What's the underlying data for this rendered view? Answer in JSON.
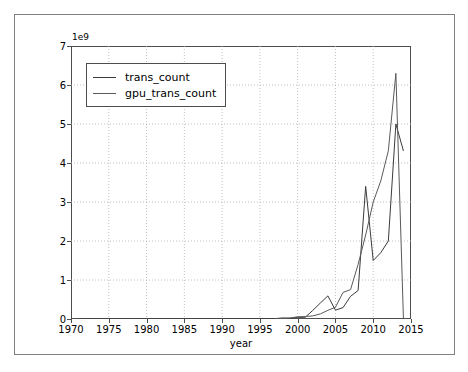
{
  "chart_data": {
    "type": "line",
    "title": "",
    "xlabel": "year",
    "ylabel": "",
    "offset_text": "1e9",
    "xlim": [
      1970,
      2015
    ],
    "ylim": [
      0,
      7000000000
    ],
    "xticks": [
      1970,
      1975,
      1980,
      1985,
      1990,
      1995,
      2000,
      2005,
      2010,
      2015
    ],
    "yticks": [
      0,
      1,
      2,
      3,
      4,
      5,
      6,
      7
    ],
    "ytick_labels": [
      "0",
      "1",
      "2",
      "3",
      "4",
      "5",
      "6",
      "7"
    ],
    "xtick_labels": [
      "1970",
      "1975",
      "1980",
      "1985",
      "1990",
      "1995",
      "2000",
      "2005",
      "2010",
      "2015"
    ],
    "grid": true,
    "grid_style": "dotted",
    "legend_position": "upper left",
    "series": [
      {
        "name": "trans_count",
        "color": "#3b3b3b",
        "x": [
          1971,
          1972,
          1974,
          1976,
          1978,
          1979,
          1982,
          1985,
          1986,
          1988,
          1989,
          1991,
          1993,
          1994,
          1995,
          1996,
          1997,
          1998,
          1999,
          2000,
          2001,
          2002,
          2003,
          2004,
          2005,
          2006,
          2007,
          2008,
          2009,
          2010,
          2011,
          2012,
          2013,
          2014
        ],
        "y": [
          2300,
          3500,
          5000,
          8500,
          29000,
          68000,
          134000,
          275000,
          273000,
          1180000,
          1200000,
          3100000,
          3100000,
          5500000,
          9300000,
          7500000,
          9500000,
          27400000,
          21300000,
          42000000,
          45000000,
          220000000,
          410000000,
          592000000,
          228000000,
          291000000,
          582000000,
          731000000,
          3400000000,
          1500000000,
          1700000000,
          2000000000,
          5000000000,
          4310000000
        ]
      },
      {
        "name": "gpu_trans_count",
        "color": "#5a5a5a",
        "x": [
          1997,
          1998,
          1999,
          2000,
          2001,
          2002,
          2003,
          2004,
          2005,
          2006,
          2007,
          2008,
          2009,
          2010,
          2011,
          2012,
          2013,
          2014
        ],
        "y": [
          3500000,
          8000000,
          25000000,
          57000000,
          63000000,
          80000000,
          130000000,
          222000000,
          302000000,
          681000000,
          754000000,
          1400000000,
          2154000000,
          3000000000,
          3540000000,
          4312000000,
          6300000000,
          8000000
        ]
      }
    ]
  },
  "legend": {
    "entries": [
      {
        "label": "trans_count"
      },
      {
        "label": "gpu_trans_count"
      }
    ]
  },
  "colors": {
    "figure_border": "#808080",
    "axes_border": "#4d4d4d",
    "grid": "#b0b0b0",
    "background": "#ffffff"
  }
}
